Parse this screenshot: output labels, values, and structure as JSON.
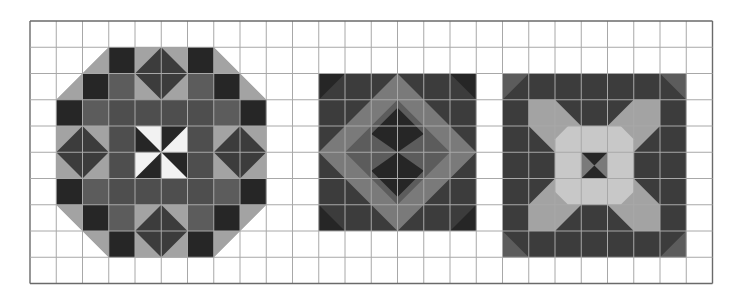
{
  "sheet": {
    "origin_x": 30,
    "origin_y": 21,
    "cell": 26.25,
    "cols": 26,
    "rows": 10,
    "grid_color": "#a8a8a8",
    "border_color": "#6a6a6a",
    "paper_color": "#ffffff"
  },
  "palette": {
    "black": "#262626",
    "dark": "#3c3c3c",
    "medium_dark": "#4e4e4e",
    "medium": "#5c5c5c",
    "medium_light": "#7a7a7a",
    "light": "#a3a3a3",
    "very_light": "#c8c8c8",
    "white": "#f2f2f2"
  },
  "blocks": [
    {
      "name": "octagon-block",
      "col": 1,
      "row": 1,
      "size": 8
    },
    {
      "name": "diamond-block",
      "col": 11,
      "row": 2,
      "size": 6
    },
    {
      "name": "cross-octagon-block",
      "col": 18,
      "row": 2,
      "size": 7
    }
  ]
}
